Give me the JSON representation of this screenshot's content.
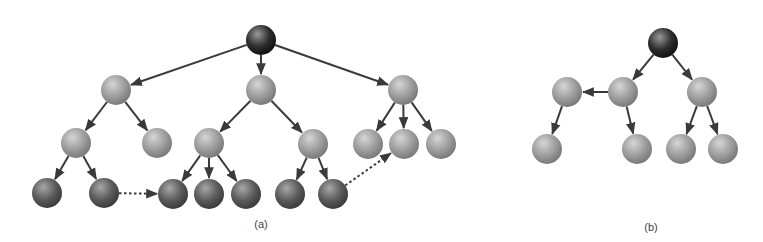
{
  "colors": {
    "background": "#ffffff",
    "edge": "#3a3a3a",
    "root_fill": "#2e2e2e",
    "root_highlight": "#9a9a9a",
    "inner_fill": "#9e9e9e",
    "inner_highlight": "#d6d6d6",
    "leaf_fill": "#5c5c5c",
    "leaf_highlight": "#a8a8a8"
  },
  "node_radius": 15,
  "diagrams": [
    {
      "id": "a",
      "label": "(a)",
      "label_pos": [
        261,
        218
      ],
      "nodes": [
        {
          "id": "r",
          "x": 261,
          "y": 40,
          "kind": "root"
        },
        {
          "id": "a1",
          "x": 116,
          "y": 90,
          "kind": "inner"
        },
        {
          "id": "a2",
          "x": 261,
          "y": 90,
          "kind": "inner"
        },
        {
          "id": "a3",
          "x": 403,
          "y": 90,
          "kind": "inner"
        },
        {
          "id": "b1",
          "x": 76,
          "y": 143,
          "kind": "inner"
        },
        {
          "id": "b2",
          "x": 157,
          "y": 143,
          "kind": "inner"
        },
        {
          "id": "b3",
          "x": 209,
          "y": 143,
          "kind": "inner"
        },
        {
          "id": "b4",
          "x": 313,
          "y": 144,
          "kind": "inner"
        },
        {
          "id": "b5",
          "x": 368,
          "y": 144,
          "kind": "inner"
        },
        {
          "id": "b6",
          "x": 404,
          "y": 144,
          "kind": "inner"
        },
        {
          "id": "b7",
          "x": 441,
          "y": 144,
          "kind": "inner"
        },
        {
          "id": "c1",
          "x": 47,
          "y": 193,
          "kind": "leaf"
        },
        {
          "id": "c2",
          "x": 104,
          "y": 193,
          "kind": "leaf"
        },
        {
          "id": "c3",
          "x": 173,
          "y": 194,
          "kind": "leaf"
        },
        {
          "id": "c4",
          "x": 209,
          "y": 194,
          "kind": "leaf"
        },
        {
          "id": "c5",
          "x": 246,
          "y": 194,
          "kind": "leaf"
        },
        {
          "id": "c6",
          "x": 290,
          "y": 194,
          "kind": "leaf"
        },
        {
          "id": "c7",
          "x": 333,
          "y": 194,
          "kind": "leaf"
        }
      ],
      "edges": [
        {
          "from": "r",
          "to": "a1",
          "style": "solid"
        },
        {
          "from": "r",
          "to": "a2",
          "style": "solid"
        },
        {
          "from": "r",
          "to": "a3",
          "style": "solid"
        },
        {
          "from": "a1",
          "to": "b1",
          "style": "solid"
        },
        {
          "from": "a1",
          "to": "b2",
          "style": "solid"
        },
        {
          "from": "a2",
          "to": "b3",
          "style": "solid"
        },
        {
          "from": "a2",
          "to": "b4",
          "style": "solid"
        },
        {
          "from": "a3",
          "to": "b5",
          "style": "solid"
        },
        {
          "from": "a3",
          "to": "b6",
          "style": "solid"
        },
        {
          "from": "a3",
          "to": "b7",
          "style": "solid"
        },
        {
          "from": "b1",
          "to": "c1",
          "style": "solid"
        },
        {
          "from": "b1",
          "to": "c2",
          "style": "solid"
        },
        {
          "from": "b3",
          "to": "c3",
          "style": "solid"
        },
        {
          "from": "b3",
          "to": "c4",
          "style": "solid"
        },
        {
          "from": "b3",
          "to": "c5",
          "style": "solid"
        },
        {
          "from": "b4",
          "to": "c6",
          "style": "solid"
        },
        {
          "from": "b4",
          "to": "c7",
          "style": "solid"
        },
        {
          "from": "c2",
          "to": "c3",
          "style": "dotted"
        },
        {
          "from": "c7",
          "to": "b6",
          "style": "dotted"
        }
      ]
    },
    {
      "id": "b",
      "label": "(b)",
      "label_pos": [
        651,
        221
      ],
      "nodes": [
        {
          "id": "r",
          "x": 663,
          "y": 43,
          "kind": "root"
        },
        {
          "id": "p1",
          "x": 567,
          "y": 92,
          "kind": "inner"
        },
        {
          "id": "p2",
          "x": 623,
          "y": 92,
          "kind": "inner"
        },
        {
          "id": "p3",
          "x": 702,
          "y": 92,
          "kind": "inner"
        },
        {
          "id": "q1",
          "x": 547,
          "y": 149,
          "kind": "inner"
        },
        {
          "id": "q2",
          "x": 637,
          "y": 149,
          "kind": "inner"
        },
        {
          "id": "q3",
          "x": 681,
          "y": 149,
          "kind": "inner"
        },
        {
          "id": "q4",
          "x": 723,
          "y": 149,
          "kind": "inner"
        }
      ],
      "edges": [
        {
          "from": "r",
          "to": "p2",
          "style": "solid"
        },
        {
          "from": "r",
          "to": "p3",
          "style": "solid"
        },
        {
          "from": "p2",
          "to": "p1",
          "style": "solid"
        },
        {
          "from": "p1",
          "to": "q1",
          "style": "solid"
        },
        {
          "from": "p2",
          "to": "q2",
          "style": "solid"
        },
        {
          "from": "p3",
          "to": "q3",
          "style": "solid"
        },
        {
          "from": "p3",
          "to": "q4",
          "style": "solid"
        }
      ]
    }
  ]
}
